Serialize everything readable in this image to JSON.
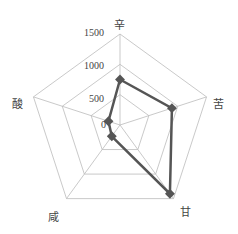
{
  "chart_data": {
    "type": "radar",
    "title": "",
    "axes": [
      "辛",
      "苦",
      "甘",
      "咸",
      "酸"
    ],
    "series": [
      {
        "name": "",
        "values": [
          750,
          900,
          1400,
          230,
          200
        ],
        "color": "#555555"
      }
    ],
    "ticks": [
      "0",
      "500",
      "1000",
      "1500"
    ],
    "range": [
      0,
      1500
    ],
    "grid": true,
    "legend": "none"
  }
}
